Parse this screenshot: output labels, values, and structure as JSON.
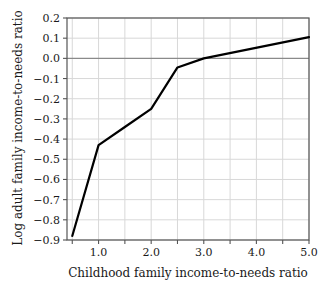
{
  "chart_data": {
    "type": "line",
    "title": "",
    "subtitle": "",
    "xlabel": "Childhood family income-to-needs ratio",
    "ylabel": "Log adult family income-to-needs ratio",
    "xlim": [
      0.4,
      5.0
    ],
    "ylim": [
      -0.9,
      0.2
    ],
    "grid": true,
    "legend": "none",
    "x_ticks": [
      0.5,
      1.0,
      1.5,
      2.0,
      2.5,
      3.0,
      3.5,
      4.0,
      4.5,
      5.0
    ],
    "x_tick_labels": [
      "",
      "1.0",
      "",
      "2.0",
      "",
      "3.0",
      "",
      "4.0",
      "",
      "5.0"
    ],
    "y_ticks": [
      0.2,
      0.1,
      0.0,
      -0.1,
      -0.2,
      -0.3,
      -0.4,
      -0.5,
      -0.6,
      -0.7,
      -0.8,
      -0.9
    ],
    "y_tick_labels": [
      "0.2",
      "0.1",
      "0.0",
      "−0.1",
      "−0.2",
      "−0.3",
      "−0.4",
      "−0.5",
      "−0.6",
      "−0.7",
      "−0.8",
      "−0.9"
    ],
    "zero_line": 0.0,
    "series": [
      {
        "name": "Log adult family income-to-needs ratio",
        "color": "#000000",
        "x": [
          0.5,
          1.0,
          1.5,
          2.0,
          2.5,
          3.0,
          5.0
        ],
        "y": [
          -0.88,
          -0.43,
          -0.34,
          -0.25,
          -0.045,
          0.0,
          0.105
        ]
      }
    ]
  },
  "style": {
    "line_color": "#000000",
    "grid_color": "#d8d8d8",
    "zero_line_color": "#8a8a8a",
    "frame_color": "#555555",
    "background": "#ffffff"
  }
}
